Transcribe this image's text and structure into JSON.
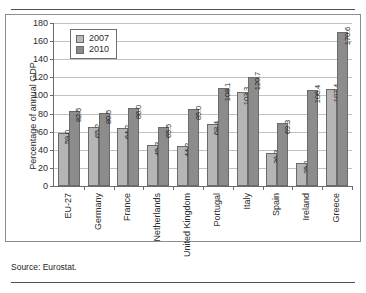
{
  "page": {
    "top_heading": "",
    "source_note": "Source: Eurostat."
  },
  "legend": {
    "position": "top-left-inside",
    "items": [
      {
        "label": "2007",
        "color": "#b5b5b5"
      },
      {
        "label": "2010",
        "color": "#8c8c8c"
      }
    ]
  },
  "axes": {
    "ylabel": "Percentage of annual GDP",
    "yticks": [
      "0",
      "20",
      "40",
      "60",
      "80",
      "100",
      "120",
      "140",
      "160",
      "180"
    ]
  },
  "chart_data": {
    "type": "bar",
    "title": "",
    "xlabel": "",
    "ylabel": "Percentage of annual GDP",
    "ylim": [
      0,
      180
    ],
    "ytick_step": 20,
    "grid": true,
    "legend_position": "upper left",
    "categories": [
      "EU-27",
      "Germany",
      "France",
      "Netherlands",
      "United Kingdom",
      "Portugal",
      "Italy",
      "Spain",
      "Ireland",
      "Greece"
    ],
    "series": [
      {
        "name": "2007",
        "color": "#b5b5b5",
        "values": [
          59.0,
          65.2,
          64.2,
          45.3,
          44.2,
          68.4,
          103.3,
          36.3,
          25.1,
          107.4
        ],
        "labels": [
          "59.0",
          "65.2",
          "64.2",
          "45.3",
          "44.2",
          "68.4",
          "103.3",
          "36.3",
          "25.1",
          "107.4"
        ]
      },
      {
        "name": "2010",
        "color": "#8c8c8c",
        "values": [
          82.5,
          80.5,
          86.0,
          65.5,
          85.0,
          108.1,
          120.7,
          69.3,
          106.4,
          170.6
        ],
        "labels": [
          "82.5",
          "80.5",
          "86.0",
          "65.5",
          "85.0",
          "108.1",
          "120.7",
          "69.3",
          "106.4",
          "170.6"
        ]
      }
    ]
  }
}
